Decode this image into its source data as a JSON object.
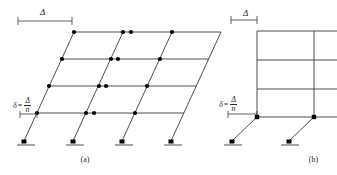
{
  "figure": {
    "width": 337,
    "height": 175,
    "background": "#ffffff",
    "line_color": "#3a3a3a",
    "node_color": "#000000",
    "text_color": "#2a2a2a"
  },
  "panels": {
    "a": {
      "caption": "(a)",
      "top_dimension": {
        "symbol": "Δ"
      },
      "story_drift": {
        "symbol": "δ",
        "equals": "=",
        "numerator": "Δ",
        "denominator": "n"
      },
      "stories": 4,
      "bays": 3,
      "description": "shear-beam frame with uniform story drift"
    },
    "b": {
      "caption": "(b)",
      "top_dimension": {
        "symbol": "Δ"
      },
      "story_drift": {
        "symbol": "δ",
        "equals": "=",
        "numerator": "Δ",
        "denominator": "n"
      },
      "stories": 4,
      "bays": 2,
      "description": "frame with drift concentrated in first story"
    }
  }
}
